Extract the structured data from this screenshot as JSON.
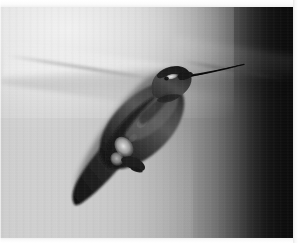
{
  "image": {
    "kind": "photograph",
    "subject": "hummingbird-in-flight",
    "title": "Hummingbird hovering in front of a wall",
    "color_mode": "grayscale",
    "width_px": 298,
    "height_px": 243,
    "visible_text": "",
    "alt_text": "Grayscale photograph of a hummingbird hovering, body angled from lower-left to upper-right, long straight beak pointing up to the right, against a softly blurred wall that shades from light gray on the left to near black on the right."
  },
  "palette": {
    "background_light": "#d2d2d2",
    "background_mid": "#949494",
    "background_dark": "#151515",
    "background_darkest": "#0b0b0b",
    "highlight_haze": "#ffffff",
    "bird_body_dark": "#2b2b2b",
    "bird_body_mid": "#4a4a4a",
    "bird_body_light": "#6e6e6e",
    "bird_shadow": "#141414",
    "bird_white_patch": "#e8e8e8",
    "eye_stripe_white": "#f2f2f2",
    "beak_dark": "#101010",
    "paper_border": "#f7f7f7"
  },
  "composition": {
    "borders": {
      "top_px": 7,
      "bottom_px": 5,
      "right_px": 5,
      "left_px": 1,
      "border_color": "#f7f7f7"
    },
    "background": {
      "gradient_direction": "left-to-right",
      "gradient_stops": [
        "#cfcfcf",
        "#c9c9c9",
        "#ababab",
        "#757575",
        "#2a2a2a",
        "#0b0b0b"
      ],
      "dark_band_start_pct": 78,
      "highlight_region": "upper-left-to-center",
      "blur_streaks": 3
    },
    "bird": {
      "orientation": "body lower-left to upper-right, beak up-right",
      "tail_tip": {
        "x": 74,
        "y": 196
      },
      "body_center": {
        "x": 130,
        "y": 120
      },
      "head_center": {
        "x": 172,
        "y": 74
      },
      "beak_base": {
        "x": 189,
        "y": 68
      },
      "beak_tip": {
        "x": 243,
        "y": 56
      },
      "eye_stripe": {
        "x": 170,
        "y": 69,
        "w": 10,
        "h": 4
      },
      "white_flank_patch": {
        "x": 118,
        "y": 139,
        "w": 15,
        "h": 20
      },
      "foot": {
        "x": 133,
        "y": 157
      }
    }
  }
}
